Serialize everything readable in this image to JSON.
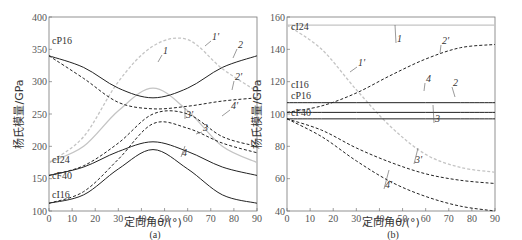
{
  "chart_data": [
    {
      "type": "line",
      "panel": "(a)",
      "xlabel": "定向角θ/(°)",
      "ylabel": "杨氏模量/GPa",
      "xlim": [
        0,
        90
      ],
      "ylim": [
        100,
        400
      ],
      "xticks": [
        0,
        10,
        20,
        30,
        40,
        50,
        60,
        70,
        80,
        90
      ],
      "yticks": [
        100,
        150,
        200,
        250,
        300,
        350,
        400
      ],
      "material_labels": [
        "cP16",
        "cI24",
        "cF40",
        "cI16"
      ],
      "x": [
        0,
        15,
        30,
        45,
        60,
        75,
        90
      ],
      "series": [
        {
          "name": "1",
          "style": "solid-gray",
          "values": [
            175,
            200,
            255,
            290,
            255,
            200,
            175
          ]
        },
        {
          "name": "1'",
          "style": "dashed-gray",
          "values": [
            175,
            215,
            300,
            355,
            365,
            320,
            285
          ]
        },
        {
          "name": "2",
          "style": "solid-black",
          "values": [
            340,
            322,
            290,
            275,
            290,
            322,
            340
          ]
        },
        {
          "name": "2'",
          "style": "dashed-black",
          "values": [
            340,
            305,
            268,
            258,
            262,
            270,
            275
          ]
        },
        {
          "name": "3",
          "style": "solid-black",
          "values": [
            155,
            168,
            192,
            207,
            192,
            168,
            155
          ]
        },
        {
          "name": "3'",
          "style": "dashed-black",
          "values": [
            155,
            170,
            205,
            250,
            250,
            215,
            200
          ]
        },
        {
          "name": "4",
          "style": "solid-black",
          "values": [
            112,
            125,
            165,
            195,
            165,
            125,
            112
          ]
        },
        {
          "name": "4'",
          "style": "dashed-black",
          "values": [
            112,
            130,
            180,
            235,
            228,
            205,
            190
          ]
        }
      ]
    },
    {
      "type": "line",
      "panel": "(b)",
      "xlabel": "定向角θ/(°)",
      "ylabel": "杨氏模量/GPa",
      "xlim": [
        0,
        90
      ],
      "ylim": [
        40,
        160
      ],
      "xticks": [
        0,
        10,
        20,
        30,
        40,
        50,
        60,
        70,
        80,
        90
      ],
      "yticks": [
        40,
        60,
        80,
        100,
        120,
        140,
        160
      ],
      "material_labels": [
        "cI24",
        "cI16",
        "cP16",
        "cF40"
      ],
      "x": [
        0,
        15,
        30,
        45,
        60,
        75,
        90
      ],
      "series": [
        {
          "name": "1",
          "style": "solid-gray",
          "values": [
            155,
            155,
            155,
            155,
            155,
            155,
            155
          ]
        },
        {
          "name": "1'",
          "style": "dashed-gray",
          "values": [
            155,
            140,
            115,
            92,
            75,
            67,
            64
          ]
        },
        {
          "name": "2",
          "style": "solid-black",
          "values": [
            101,
            101,
            101,
            101,
            101,
            101,
            101
          ]
        },
        {
          "name": "2'",
          "style": "dashed-black",
          "values": [
            101,
            105,
            113,
            124,
            134,
            141,
            143
          ]
        },
        {
          "name": "3",
          "style": "solid-black",
          "values": [
            97,
            97,
            97,
            97,
            97,
            97,
            97
          ]
        },
        {
          "name": "3'",
          "style": "dashed-black",
          "values": [
            97,
            90,
            79,
            70,
            63,
            59,
            57
          ]
        },
        {
          "name": "4",
          "style": "solid-black",
          "values": [
            107,
            107,
            107,
            107,
            107,
            107,
            107
          ]
        },
        {
          "name": "4'",
          "style": "dashed-black",
          "values": [
            97,
            86,
            71,
            58,
            49,
            43,
            40
          ]
        }
      ]
    }
  ],
  "labels": {
    "panel_a": "(a)",
    "panel_b": "(b)",
    "xlabel": "定向角θ/(°)",
    "ylabel": "杨氏模量/GPa"
  }
}
